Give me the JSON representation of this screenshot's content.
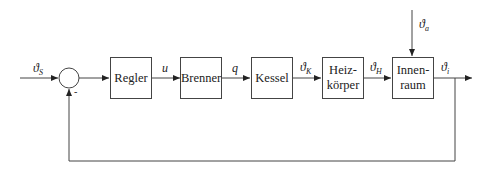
{
  "diagram": {
    "type": "feedback-control-loop",
    "blocks": [
      {
        "id": "regler",
        "label": "Regler"
      },
      {
        "id": "brenner",
        "label": "Brenner"
      },
      {
        "id": "kessel",
        "label": "Kessel"
      },
      {
        "id": "heizkoerper",
        "label_line1": "Heiz-",
        "label_line2": "körper"
      },
      {
        "id": "innenraum",
        "label_line1": "Innen-",
        "label_line2": "raum"
      }
    ],
    "signals": {
      "setpoint": {
        "sym": "ϑ",
        "sub": "S"
      },
      "u": {
        "sym": "u"
      },
      "q": {
        "sym": "q"
      },
      "theta_k": {
        "sym": "ϑ",
        "sub": "K"
      },
      "theta_h": {
        "sym": "ϑ",
        "sub": "H"
      },
      "theta_i": {
        "sym": "ϑ",
        "sub": "i"
      },
      "theta_a": {
        "sym": "ϑ",
        "sub": "a"
      }
    },
    "summing_junction": {
      "feedback_sign": "-"
    }
  }
}
